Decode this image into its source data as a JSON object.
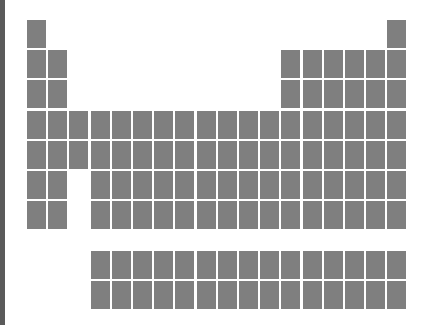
{
  "figure": {
    "colors": {
      "cell": "#7f7f7f",
      "left_bar": "#5a5a5a",
      "background": "#ffffff"
    },
    "layout": {
      "origin_x": 27,
      "origin_y": 20,
      "col_pitch": 21.2,
      "row_pitch": 30.2,
      "cell_width": 19,
      "cell_height": 28,
      "fblock_y": [
        251,
        281
      ],
      "fblock_start_col": 4,
      "fblock_end_col": 18
    },
    "rows": [
      {
        "period": 1,
        "columns": [
          1,
          18
        ]
      },
      {
        "period": 2,
        "columns": [
          1,
          2,
          13,
          14,
          15,
          16,
          17,
          18
        ]
      },
      {
        "period": 3,
        "columns": [
          1,
          2,
          13,
          14,
          15,
          16,
          17,
          18
        ]
      },
      {
        "period": 4,
        "columns": [
          1,
          2,
          3,
          4,
          5,
          6,
          7,
          8,
          9,
          10,
          11,
          12,
          13,
          14,
          15,
          16,
          17,
          18
        ]
      },
      {
        "period": 5,
        "columns": [
          1,
          2,
          3,
          4,
          5,
          6,
          7,
          8,
          9,
          10,
          11,
          12,
          13,
          14,
          15,
          16,
          17,
          18
        ]
      },
      {
        "period": 6,
        "columns": [
          1,
          2,
          4,
          5,
          6,
          7,
          8,
          9,
          10,
          11,
          12,
          13,
          14,
          15,
          16,
          17,
          18
        ]
      },
      {
        "period": 7,
        "columns": [
          1,
          2,
          4,
          5,
          6,
          7,
          8,
          9,
          10,
          11,
          12,
          13,
          14,
          15,
          16,
          17,
          18
        ]
      }
    ],
    "fblock_rows": [
      {
        "name": "lanthanides",
        "count": 15
      },
      {
        "name": "actinides",
        "count": 15
      }
    ]
  }
}
